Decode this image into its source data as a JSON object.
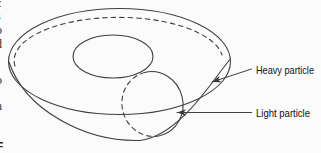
{
  "figure": {
    "background": "#fbfbfb",
    "stroke_color": "#3f3f3f",
    "text_color": "#111111"
  },
  "labels": {
    "heavy_particle": "Heavy particle",
    "light_particle": "Light particle"
  },
  "left_margin_fragments": [
    "c",
    "s",
    "o",
    "d",
    "-",
    "o",
    "-",
    "n",
    "t",
    ".",
    "F"
  ]
}
